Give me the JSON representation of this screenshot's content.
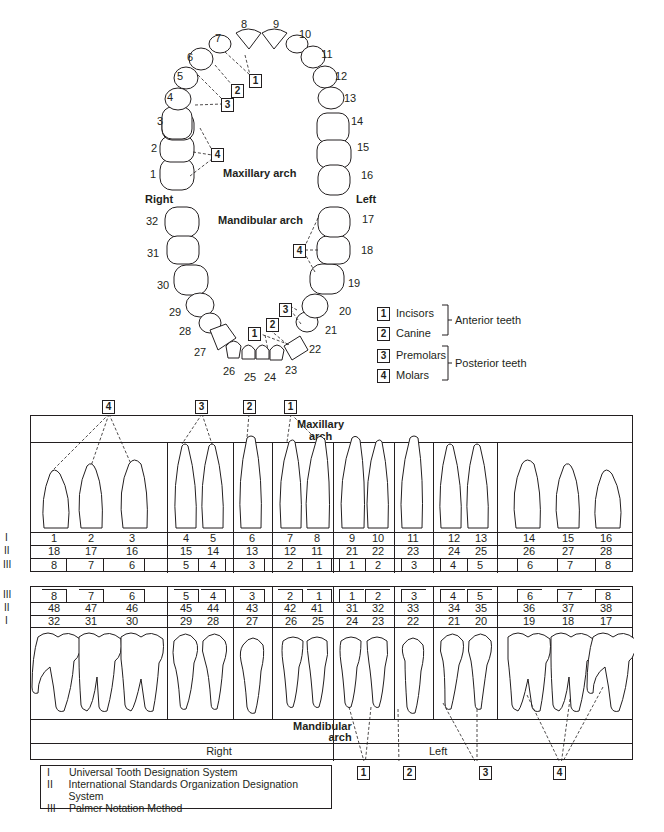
{
  "arch_diagram": {
    "maxillary_label": "Maxillary arch",
    "mandibular_label": "Mandibular arch",
    "side_right": "Right",
    "side_left": "Left",
    "maxillary_teeth": [
      "1",
      "2",
      "3",
      "4",
      "5",
      "6",
      "7",
      "8",
      "9",
      "10",
      "11",
      "12",
      "13",
      "14",
      "15",
      "16"
    ],
    "mandibular_teeth": [
      "17",
      "18",
      "19",
      "20",
      "21",
      "22",
      "23",
      "24",
      "25",
      "26",
      "27",
      "28",
      "29",
      "30",
      "31",
      "32"
    ],
    "callouts": [
      "1",
      "2",
      "3",
      "4"
    ]
  },
  "classification_legend": {
    "items": [
      {
        "key": "1",
        "label": "Incisors"
      },
      {
        "key": "2",
        "label": "Canine"
      },
      {
        "key": "3",
        "label": "Premolars"
      },
      {
        "key": "4",
        "label": "Molars"
      }
    ],
    "groups": [
      {
        "label": "Anterior teeth",
        "members": [
          "1",
          "2"
        ]
      },
      {
        "label": "Posterior teeth",
        "members": [
          "3",
          "4"
        ]
      }
    ]
  },
  "chart": {
    "maxillary_label_line1": "Maxillary",
    "maxillary_label_line2": "arch",
    "mandibular_label_line1": "Mandibular",
    "mandibular_label_line2": "arch",
    "right_label": "Right",
    "left_label": "Left",
    "row_labels": {
      "I": "I",
      "II": "II",
      "III": "III"
    },
    "top_callouts": [
      "4",
      "3",
      "2",
      "1"
    ],
    "bottom_callouts": [
      "1",
      "2",
      "3",
      "4"
    ],
    "maxillary": {
      "universal": [
        "1",
        "2",
        "3",
        "4",
        "5",
        "6",
        "7",
        "8",
        "9",
        "10",
        "11",
        "12",
        "13",
        "14",
        "15",
        "16"
      ],
      "iso": [
        "18",
        "17",
        "16",
        "15",
        "14",
        "13",
        "12",
        "11",
        "21",
        "22",
        "23",
        "24",
        "25",
        "26",
        "27",
        "28"
      ],
      "palmer": [
        "8",
        "7",
        "6",
        "5",
        "4",
        "3",
        "2",
        "1",
        "1",
        "2",
        "3",
        "4",
        "5",
        "6",
        "7",
        "8"
      ]
    },
    "mandibular": {
      "palmer": [
        "8",
        "7",
        "6",
        "5",
        "4",
        "3",
        "2",
        "1",
        "1",
        "2",
        "3",
        "4",
        "5",
        "6",
        "7",
        "8"
      ],
      "iso": [
        "48",
        "47",
        "46",
        "45",
        "44",
        "43",
        "42",
        "41",
        "31",
        "32",
        "33",
        "34",
        "35",
        "36",
        "37",
        "38"
      ],
      "universal": [
        "32",
        "31",
        "30",
        "29",
        "28",
        "27",
        "26",
        "25",
        "24",
        "23",
        "22",
        "21",
        "20",
        "19",
        "18",
        "17"
      ]
    }
  },
  "systems_legend": [
    {
      "key": "I",
      "label": "Universal Tooth Designation System"
    },
    {
      "key": "II",
      "label": "International Standards Organization Designation System"
    },
    {
      "key": "III",
      "label": "Palmer Notation Method"
    }
  ]
}
